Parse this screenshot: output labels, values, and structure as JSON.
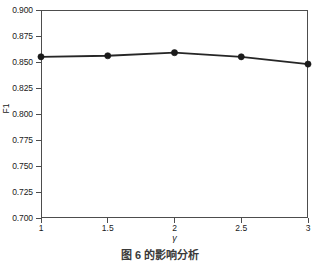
{
  "chart_data": {
    "type": "line",
    "title": "",
    "xlabel": "γ",
    "ylabel": "F1",
    "x": [
      1,
      1.5,
      2,
      2.5,
      3
    ],
    "values": [
      0.855,
      0.856,
      0.859,
      0.855,
      0.848
    ],
    "series": [
      {
        "name": "F1",
        "values": [
          0.855,
          0.856,
          0.859,
          0.855,
          0.848
        ]
      }
    ],
    "xlim": [
      1,
      3
    ],
    "ylim": [
      0.7,
      0.9
    ],
    "xticks": [
      "1",
      "1.5",
      "2",
      "2.5",
      "3"
    ],
    "xtick_values": [
      1,
      1.5,
      2,
      2.5,
      3
    ],
    "yticks": [
      "0.700",
      "0.725",
      "0.750",
      "0.775",
      "0.800",
      "0.825",
      "0.850",
      "0.875",
      "0.900"
    ],
    "ytick_values": [
      0.7,
      0.725,
      0.75,
      0.775,
      0.8,
      0.825,
      0.85,
      0.875,
      0.9
    ],
    "grid": false,
    "legend": null,
    "marker": "circle",
    "line_color": "#262626",
    "marker_color": "#1a1a1a"
  },
  "caption": {
    "text": "图 6   的影响分析"
  }
}
